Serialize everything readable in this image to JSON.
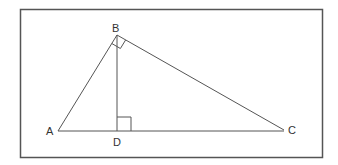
{
  "diagram": {
    "type": "geometry-right-triangle-with-altitude",
    "frame": {
      "x": 20,
      "y": 9,
      "width": 302,
      "height": 148,
      "stroke": "#555555"
    },
    "line_color": "#555555",
    "points": {
      "A": {
        "label": "A",
        "x": 58,
        "y": 131
      },
      "B": {
        "label": "B",
        "x": 117,
        "y": 35
      },
      "C": {
        "label": "C",
        "x": 284,
        "y": 130
      },
      "D": {
        "label": "D",
        "x": 117,
        "y": 131
      }
    },
    "segments": [
      {
        "from": "A",
        "to": "B"
      },
      {
        "from": "B",
        "to": "C"
      },
      {
        "from": "A",
        "to": "C"
      },
      {
        "from": "B",
        "to": "D"
      }
    ],
    "right_angles": [
      {
        "at": "B",
        "between": [
          "A",
          "C"
        ]
      },
      {
        "at": "D",
        "between": [
          "B",
          "C"
        ]
      }
    ]
  }
}
